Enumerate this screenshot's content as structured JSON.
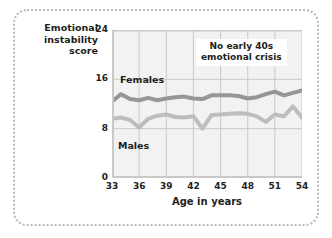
{
  "chart_data": {
    "type": "line",
    "title": "",
    "xlabel": "Age in years",
    "ylabel": "Emotional instability score",
    "ylabel_lines": [
      "Emotional",
      "instability",
      "score"
    ],
    "xlim": [
      33,
      54
    ],
    "ylim": [
      0,
      24
    ],
    "yticks": [
      24,
      16,
      8,
      0
    ],
    "xticks": [
      33,
      36,
      39,
      42,
      45,
      48,
      51,
      54
    ],
    "grid": "both",
    "legend": "inline-labels",
    "annotations": [
      {
        "text_lines": [
          "No early 40s",
          "emotional crisis"
        ],
        "x": 47.5,
        "y": 21
      }
    ],
    "x": [
      33,
      34,
      35,
      36,
      37,
      38,
      39,
      40,
      41,
      42,
      43,
      44,
      45,
      46,
      47,
      48,
      49,
      50,
      51,
      52,
      53,
      54
    ],
    "series": [
      {
        "name": "Females",
        "color": "#969696",
        "values": [
          12.4,
          13.6,
          12.8,
          12.6,
          13.0,
          12.6,
          12.9,
          13.1,
          13.2,
          12.9,
          12.8,
          13.4,
          13.4,
          13.4,
          13.3,
          12.9,
          13.1,
          13.6,
          14.0,
          13.4,
          13.8,
          14.2
        ]
      },
      {
        "name": "Males",
        "color": "#bdbdbd",
        "values": [
          9.6,
          9.8,
          9.4,
          8.2,
          9.6,
          10.1,
          10.3,
          9.9,
          9.8,
          10.0,
          8.0,
          10.2,
          10.3,
          10.4,
          10.5,
          10.4,
          10.0,
          9.1,
          10.3,
          10.0,
          11.6,
          9.8
        ]
      }
    ]
  },
  "labels": {
    "females": "Females",
    "males": "Males"
  }
}
